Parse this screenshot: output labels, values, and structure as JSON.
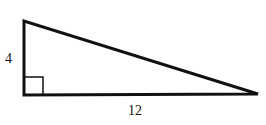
{
  "diagram": {
    "type": "right-triangle",
    "labels": {
      "vertical_leg": "4",
      "horizontal_leg": "12"
    },
    "vertices": {
      "top": [
        24,
        21
      ],
      "right_angle": [
        24,
        95
      ],
      "right": [
        258,
        94
      ]
    },
    "right_angle_marker": true,
    "stroke_color": "#111111"
  }
}
